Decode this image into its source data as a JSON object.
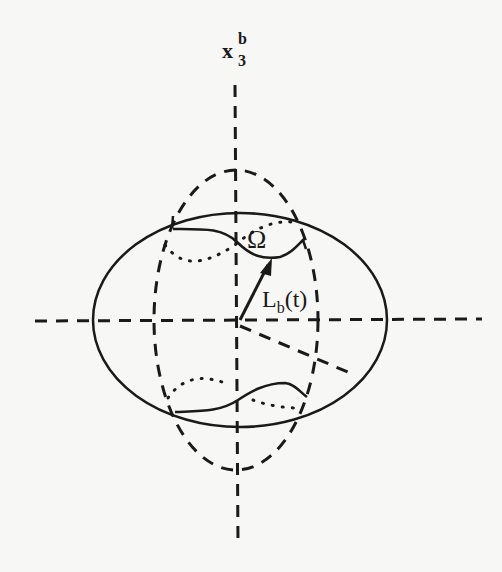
{
  "figure": {
    "axis_label": {
      "base": "x",
      "superscript": "b",
      "subscript": "3"
    },
    "region_label": "Ω",
    "vector_label": {
      "base": "L",
      "subscript": "b",
      "argument": "(t)"
    },
    "colors": {
      "ink": "#1a1a1a",
      "background": "#f7f7f5"
    },
    "elements": [
      "solid ellipse (outer body)",
      "dashed ellipse (meridian)",
      "vertical dashed axis x3b",
      "horizontal dashed axis",
      "diagonal dashed axis",
      "position vector arrow Lb(t)",
      "top region boundary Omega",
      "bottom mirrored region"
    ]
  }
}
